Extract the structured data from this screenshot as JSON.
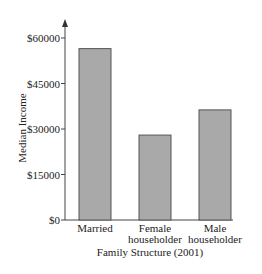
{
  "chart_data": {
    "type": "bar",
    "title": "",
    "xlabel": "Family Structure (2001)",
    "ylabel": "Median Income",
    "categories": [
      "Married",
      "Female householder",
      "Male householder"
    ],
    "category_lines": [
      [
        "Married"
      ],
      [
        "Female",
        "householder"
      ],
      [
        "Male",
        "householder"
      ]
    ],
    "values": [
      56500,
      28000,
      36300
    ],
    "ylim": [
      0,
      60000
    ],
    "yticks": [
      0,
      15000,
      30000,
      45000,
      60000
    ],
    "ytick_labels": [
      "$0",
      "$15000",
      "$30000",
      "$45000",
      "$60000"
    ],
    "grid": false,
    "legend": null,
    "bar_color": "#a9a9a9",
    "bar_edge_color": "#555555"
  }
}
